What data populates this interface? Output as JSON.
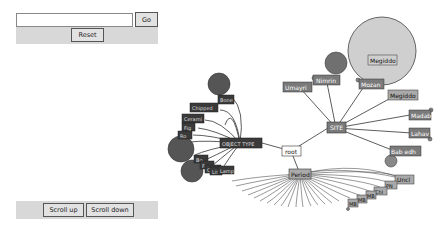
{
  "controls": {
    "search_value": "",
    "go_label": "Go",
    "reset_label": "Reset",
    "scroll_up_label": "Scroll up",
    "scroll_down_label": "Scroll down"
  },
  "graph": {
    "root": "root",
    "branches": {
      "object_type": "OBJECT TYPE",
      "site": "SITE",
      "period": "Period"
    },
    "site_nodes": [
      "Umayri",
      "Nimrin",
      "Mozan",
      "Megiddo",
      "Megiddo",
      "Madab",
      "Lahav",
      "Bab edh"
    ],
    "site_big_circle_label": "Megiddo",
    "object_type_nodes": [
      "Bone",
      "Chipped",
      "Cerami",
      "Fig",
      "Ro",
      "Bo",
      "Fa",
      "Coin",
      "Lit",
      "Lamp"
    ],
    "period_nodes": [
      "Uncl",
      "PN",
      "Chl",
      "MB",
      "MB",
      "MB"
    ]
  },
  "colors": {
    "node_fill": "#7a7a7a",
    "dark_node_fill": "#3a3a3a",
    "big_circle": "#cfcfcf",
    "circle_dark": "#555555",
    "line": "#333333",
    "panel_bg": "#d8d8d8"
  }
}
